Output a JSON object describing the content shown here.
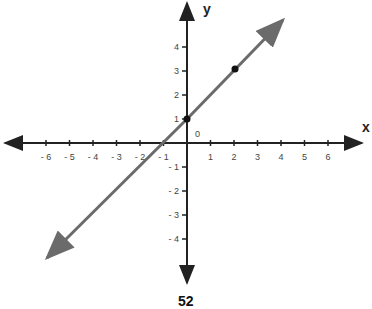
{
  "chart_data": {
    "type": "line",
    "title": "",
    "xlabel": "x",
    "ylabel": "y",
    "origin_label": "0",
    "xlim": [
      -7.5,
      7.5
    ],
    "ylim": [
      -5.8,
      5.8
    ],
    "x_ticks": [
      -6,
      -5,
      -4,
      -3,
      -2,
      -1,
      1,
      2,
      3,
      4,
      5,
      6
    ],
    "y_ticks": [
      -4,
      -3,
      -2,
      -1,
      1,
      2,
      3,
      4
    ],
    "grid": false,
    "series": [
      {
        "name": "line y = x + 1",
        "equation": "y = x + 1",
        "slope": 1,
        "intercept": 1,
        "points": [
          {
            "x": 0,
            "y": 1
          },
          {
            "x": 2,
            "y": 3
          }
        ],
        "color": "#6b6b6b",
        "arrows_both_ends": true
      }
    ]
  },
  "page_number": "52"
}
